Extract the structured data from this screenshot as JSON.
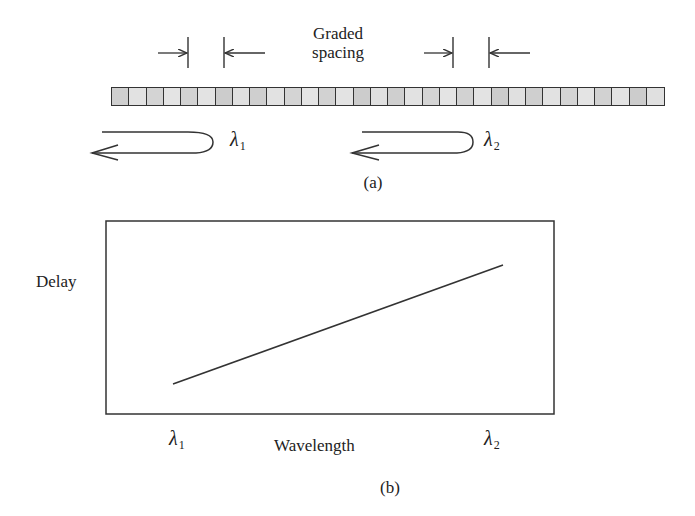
{
  "part_a": {
    "caption": "(a)",
    "spacing_label_line1": "Graded",
    "spacing_label_line2": "spacing",
    "grating": {
      "cell_count": 32,
      "colors": [
        "#cfcfcf",
        "#e2e2e2",
        "#d4d4d4",
        "#e4e4e4",
        "#d2d2d2",
        "#e3e3e3",
        "#cccccc",
        "#e0e0e0"
      ]
    },
    "reflection_1": {
      "symbol": "λ",
      "subscript": "1"
    },
    "reflection_2": {
      "symbol": "λ",
      "subscript": "2"
    }
  },
  "part_b": {
    "caption": "(b)",
    "y_label": "Delay",
    "x_label": "Wavelength",
    "x_tick_left": {
      "symbol": "λ",
      "subscript": "1"
    },
    "x_tick_right": {
      "symbol": "λ",
      "subscript": "2"
    }
  },
  "chart_data": {
    "type": "line",
    "title": "",
    "xlabel": "Wavelength",
    "ylabel": "Delay",
    "x_ticks": [
      "λ1",
      "λ2"
    ],
    "series": [
      {
        "name": "Delay vs wavelength",
        "x": [
          "λ1",
          "λ2"
        ],
        "values": [
          0.15,
          0.78
        ]
      }
    ],
    "ylim": [
      0,
      1
    ],
    "grid": false,
    "legend": "none"
  }
}
